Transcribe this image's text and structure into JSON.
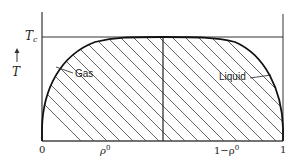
{
  "diagram": {
    "y_axis": {
      "label": "T",
      "arrow": "up-arrow",
      "critical_label_main": "T",
      "critical_label_sub": "c"
    },
    "x_axis": {
      "ticks": [
        {
          "label": "0",
          "x": 42
        },
        {
          "label_main": "ρ",
          "label_sup": "0",
          "x": 103
        },
        {
          "label_main": "1−ρ",
          "label_sup": "0",
          "x": 223
        },
        {
          "label": "1",
          "x": 283
        }
      ]
    },
    "regions": {
      "gas_label": "Gas",
      "liquid_label": "Liquid"
    },
    "geometry": {
      "plot_left": 42,
      "plot_right": 283,
      "plot_top": 12,
      "plot_bottom": 141,
      "tc_y": 37,
      "center_x": 163
    },
    "colors": {
      "line": "#1a1a1a",
      "hatch": "#555555",
      "background": "#ffffff"
    }
  }
}
